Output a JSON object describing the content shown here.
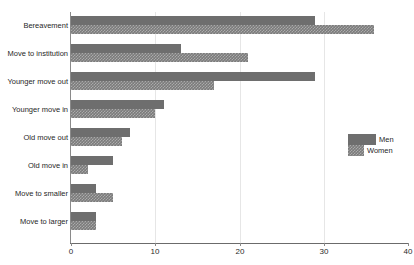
{
  "chart_data": {
    "type": "bar",
    "orientation": "horizontal",
    "title": "",
    "subtitle": "",
    "xlabel": "",
    "ylabel": "",
    "xlim": [
      0,
      40
    ],
    "xticks": [
      0,
      10,
      20,
      30,
      40
    ],
    "xtick_labels": [
      "0",
      "10",
      "20",
      "30",
      "40"
    ],
    "grid": true,
    "grid_axis": "x",
    "legend_position": "right",
    "categories": [
      "Bereavement",
      "Move to institution",
      "Younger move out",
      "Younger move in",
      "Old move out",
      "Old move in",
      "Move to smaller",
      "Move to larger"
    ],
    "series": [
      {
        "name": "Men",
        "color": "#6e6e6e",
        "values": [
          29,
          13,
          29,
          11,
          7,
          5,
          3,
          3
        ]
      },
      {
        "name": "Women",
        "color": "#7b7b7b",
        "values": [
          36,
          21,
          17,
          10,
          6,
          2,
          5,
          3
        ]
      }
    ]
  },
  "legend": {
    "items": [
      {
        "label": "Men"
      },
      {
        "label": "Women"
      }
    ]
  }
}
